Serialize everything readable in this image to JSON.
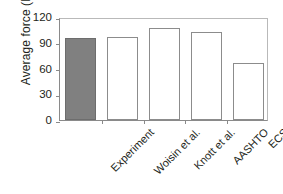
{
  "chart_data": {
    "type": "bar",
    "title": "",
    "subtitle": "",
    "xlabel": "",
    "ylabel": "Average force (MN)",
    "categories": [
      "Experiment",
      "Woisin et al.",
      "Knott et al.",
      "AASHTO",
      "ECS"
    ],
    "values": [
      96,
      97,
      107,
      102,
      66
    ],
    "series": [
      {
        "name": "Average force",
        "values": [
          96,
          97,
          107,
          102,
          66
        ]
      }
    ],
    "ylim": [
      0,
      120
    ],
    "yticks": [
      "0",
      "30",
      "60",
      "90",
      "120"
    ],
    "ytick_values": [
      0,
      30,
      60,
      90,
      120
    ],
    "grid": false,
    "legend": "none",
    "bar_styles": [
      "filled",
      "hollow",
      "hollow",
      "hollow",
      "hollow"
    ],
    "colors": {
      "filled_bar": "#808080",
      "hollow_bar": "#ffffff",
      "bar_border": "#8c8c8c",
      "axis": "#8a8a8a",
      "text": "#231f20",
      "background": "#ffffff"
    }
  }
}
